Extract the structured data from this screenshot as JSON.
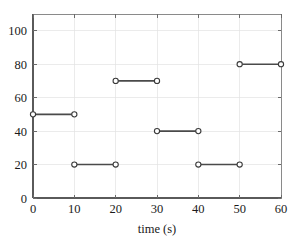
{
  "chart_data": {
    "type": "line",
    "title": "",
    "xlabel": "time (s)",
    "ylabel": "",
    "xlim": [
      0,
      60
    ],
    "ylim": [
      0,
      110
    ],
    "xticks": [
      0,
      10,
      20,
      30,
      40,
      50,
      60
    ],
    "yticks": [
      0,
      20,
      40,
      60,
      80,
      100
    ],
    "xtick_labels": [
      "0",
      "10",
      "20",
      "30",
      "40",
      "50",
      "60"
    ],
    "ytick_labels": [
      "0",
      "20",
      "40",
      "60",
      "80",
      "100"
    ],
    "grid": true,
    "legend": null,
    "marker": "open-circle",
    "line_color": "#4a4a4a",
    "marker_edge_color": "#3a3a3a",
    "marker_face_color": "#ffffff",
    "grid_color": "#e2e2e2",
    "background_color": "#ffffff",
    "segments": [
      {
        "x_start": 0,
        "x_end": 10,
        "y": 50
      },
      {
        "x_start": 10,
        "x_end": 20,
        "y": 20
      },
      {
        "x_start": 20,
        "x_end": 30,
        "y": 70
      },
      {
        "x_start": 30,
        "x_end": 40,
        "y": 40
      },
      {
        "x_start": 40,
        "x_end": 50,
        "y": 20
      },
      {
        "x_start": 50,
        "x_end": 60,
        "y": 80
      }
    ],
    "points": [
      {
        "x": 0,
        "y": 50
      },
      {
        "x": 10,
        "y": 50
      },
      {
        "x": 10,
        "y": 20
      },
      {
        "x": 20,
        "y": 20
      },
      {
        "x": 20,
        "y": 70
      },
      {
        "x": 30,
        "y": 70
      },
      {
        "x": 30,
        "y": 40
      },
      {
        "x": 40,
        "y": 40
      },
      {
        "x": 40,
        "y": 20
      },
      {
        "x": 50,
        "y": 20
      },
      {
        "x": 50,
        "y": 80
      },
      {
        "x": 60,
        "y": 80
      }
    ]
  },
  "plot_geometry": {
    "left": 33,
    "right": 281,
    "top": 14,
    "bottom": 198
  }
}
